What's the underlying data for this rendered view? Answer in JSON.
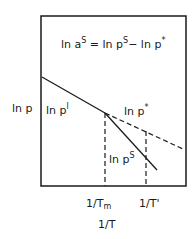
{
  "equation": {
    "lhs": "ln a",
    "lhs_sup": "S",
    "eq": " = ln p",
    "mid_sup": "S",
    "rhs": "− ln p",
    "rhs_sup": "*"
  },
  "y_axis_label": "ln p",
  "curves": {
    "liquid": {
      "label": "ln p",
      "sup": "l"
    },
    "supercooled": {
      "label": "ln p",
      "sup": "*"
    },
    "solid": {
      "label": "ln p",
      "sup": "S"
    }
  },
  "x_ticks": [
    {
      "label": "1/T",
      "sub": "m"
    },
    {
      "label": "1/T'",
      "sub": ""
    }
  ],
  "x_axis_label": "1/T"
}
